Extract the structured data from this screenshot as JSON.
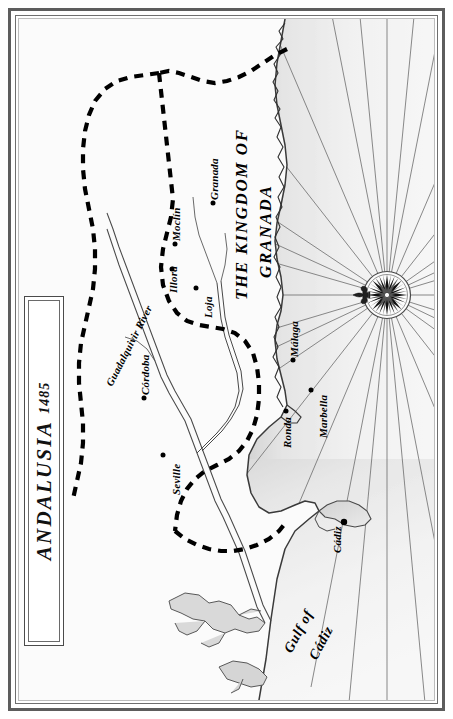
{
  "map": {
    "title": "ANDALUSIA",
    "year": "1485",
    "orientation_note": "north-to-left",
    "regions": [
      {
        "name": "region-kingdom-granada",
        "line1": "THE KINGDOM OF",
        "line2": "GRANADA"
      }
    ],
    "cities": [
      {
        "name": "Granada",
        "x": 213,
        "y": 203
      },
      {
        "name": "Moclín",
        "x": 175,
        "y": 244
      },
      {
        "name": "Illora",
        "x": 172,
        "y": 269
      },
      {
        "name": "Loja",
        "x": 196,
        "y": 288
      },
      {
        "name": "Málaga",
        "x": 293,
        "y": 360
      },
      {
        "name": "Marbella",
        "x": 311,
        "y": 390
      },
      {
        "name": "Ronda",
        "x": 286,
        "y": 411
      },
      {
        "name": "Córdoba",
        "x": 144,
        "y": 398
      },
      {
        "name": "Seville",
        "x": 163,
        "y": 455
      },
      {
        "name": "Cádiz",
        "x": 325,
        "y": 503
      }
    ],
    "rivers": [
      {
        "name": "Guadalquivir River"
      }
    ],
    "waters": [
      {
        "name": "Gulf of Cádiz",
        "line1": "Gulf of",
        "line2": "Cádiz"
      }
    ],
    "compass": {
      "name": "compass-rose",
      "points": 32,
      "pointer": "fleur-de-lis"
    },
    "legend_note": "dashed line denotes frontier"
  },
  "colors": {
    "ink": "#000000",
    "frame": "#5d5d5d",
    "sea_tint": "#e9e9e9",
    "coast": "#555555",
    "paper": "#ffffff"
  }
}
